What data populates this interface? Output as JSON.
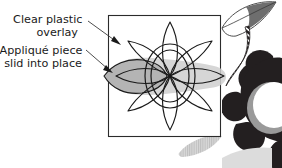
{
  "figure": {
    "background_color": "#ffffff"
  },
  "callouts": [
    {
      "id": "clear-plastic-overlay",
      "line1": "Clear plastic",
      "line2": "overlay",
      "text_color": "#1a1a1a",
      "arrow_from": [
        88,
        21
      ],
      "arrow_to": [
        121,
        45
      ]
    },
    {
      "id": "applique-piece",
      "line1": "Appliqué piece",
      "line2": "slid into place",
      "text_color": "#1a1a1a",
      "arrow_from": [
        86,
        50
      ],
      "arrow_to": [
        113,
        73
      ]
    }
  ],
  "overlay_box": {
    "name": "clear-plastic-overlay-rect",
    "x": 108,
    "y": 15,
    "width": 113,
    "height": 122,
    "stroke": "#2b2b2b",
    "fill": "none"
  },
  "flower_outline": {
    "name": "flower-outline",
    "petal_count": 8,
    "center_x": 170,
    "center_y": 76,
    "stroke": "#1a1a1a",
    "fill": "#ffffff",
    "center_outer_rx": 25,
    "center_outer_ry": 32,
    "center_inner_rx": 19,
    "center_inner_ry": 26
  },
  "applique_piece": {
    "name": "applique-piece-shape",
    "fill": "#b4b4b4",
    "shadow_fill": "#cbcbcb",
    "stroke": "#1a1a1a"
  },
  "dark_flower": {
    "name": "dark-flower",
    "fill": "#231f20",
    "center_fill": "#ffffff",
    "center_shadow_fill": "#9a9a9a",
    "center_x": 272,
    "center_y": 108
  },
  "stem": {
    "name": "striped-stem",
    "fill": "#231f20",
    "stripe_fill": "#ffffff"
  },
  "leaves": [
    {
      "name": "leaf-top-right",
      "fill": "#ffffff",
      "shade_fill": "#6e6e6e",
      "stroke": "#2b2b2b"
    },
    {
      "name": "leaf-bottom-gray",
      "fill": "#c8c8c8"
    },
    {
      "name": "leaf-bottom-left-gray",
      "fill": "#d6d6d6"
    }
  ],
  "colors": {
    "ink": "#1a1a1a",
    "line": "#2b2b2b",
    "gray_mid": "#b4b4b4",
    "gray_light": "#cbcbcb",
    "black": "#231f20"
  }
}
